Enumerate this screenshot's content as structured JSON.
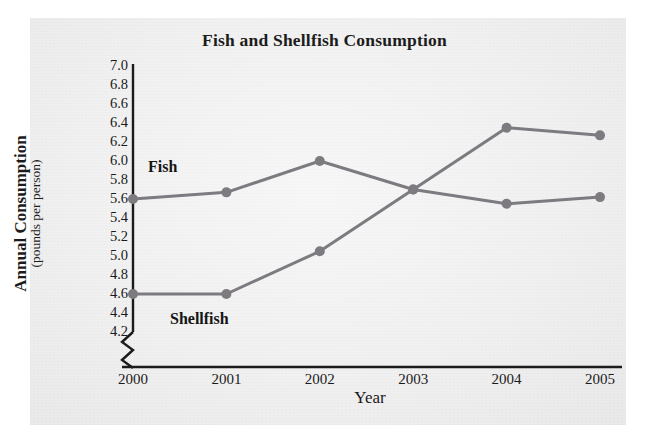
{
  "chart_data": {
    "type": "line",
    "title": "Fish and Shellfish Consumption",
    "xlabel": "Year",
    "ylabel": "Annual Consumption",
    "ylabel_sub": "(pounds per person)",
    "categories": [
      "2000",
      "2001",
      "2002",
      "2003",
      "2004",
      "2005"
    ],
    "x": [
      2000,
      2001,
      2002,
      2003,
      2004,
      2005
    ],
    "series": [
      {
        "name": "Fish",
        "values": [
          5.6,
          5.67,
          6.0,
          5.7,
          5.55,
          5.62
        ]
      },
      {
        "name": "Shellfish",
        "values": [
          4.6,
          4.6,
          5.05,
          5.7,
          6.35,
          6.27
        ]
      }
    ],
    "ylim": [
      4.1,
      7.0
    ],
    "yticks": [
      "7.0",
      "6.8",
      "6.6",
      "6.4",
      "6.2",
      "6.0",
      "5.8",
      "5.6",
      "5.4",
      "5.2",
      "5.0",
      "4.8",
      "4.6",
      "4.4",
      "4.2"
    ],
    "ytick_values": [
      7.0,
      6.8,
      6.6,
      6.4,
      6.2,
      6.0,
      5.8,
      5.6,
      5.4,
      5.2,
      5.0,
      4.8,
      4.6,
      4.4,
      4.2
    ],
    "grid": false,
    "axis_break": true,
    "legend_position": "inline-labels",
    "series_color": "#7d7a80",
    "axis_color": "#1b1b1b",
    "background_color": "#eeeeee"
  },
  "annotations": {
    "fish_label": "Fish",
    "shellfish_label": "Shellfish"
  }
}
